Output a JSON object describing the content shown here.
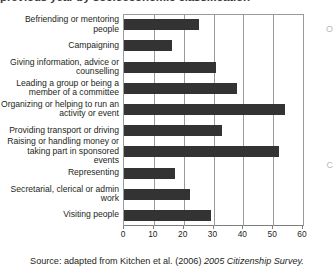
{
  "title_clipped": "previous year by socioeconomic classification",
  "source": {
    "prefix": "Source: adapted from Kitchen et al. (2006) ",
    "italic": "2005 Citizenship Survey."
  },
  "edge_glyphs": [
    "O",
    "C"
  ],
  "chart_data": {
    "type": "bar",
    "orientation": "horizontal",
    "title": "previous year by socioeconomic classification",
    "xlabel": "",
    "ylabel": "",
    "xlim": [
      0,
      60
    ],
    "xticks": [
      0,
      10,
      20,
      30,
      40,
      50,
      60
    ],
    "grid": true,
    "legend": "none",
    "bar_color": "#333333",
    "categories": [
      "Befriending or mentoring people",
      "Campaigning",
      "Giving information, advice or counselling",
      "Leading a group or being a member of a committee",
      "Organizing or helping to run an activity or event",
      "Providing transport or driving",
      "Raising or handling money or taking part in sponsored events",
      "Representing",
      "Secretarial, clerical or admin work",
      "Visiting people"
    ],
    "values": [
      25,
      16,
      31,
      38,
      54,
      33,
      52,
      17,
      22,
      29
    ]
  }
}
